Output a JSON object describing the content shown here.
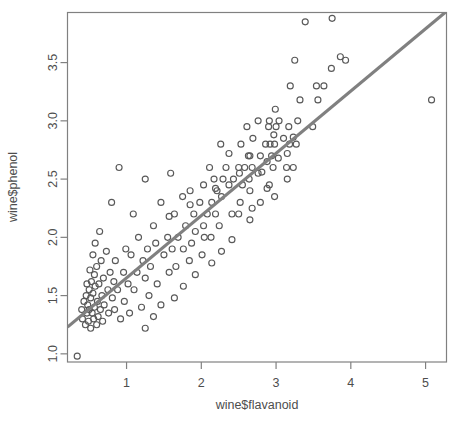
{
  "chart_data": {
    "type": "scatter",
    "title": "",
    "subtitle": "",
    "xlabel": "wine$flavanoid",
    "ylabel": "wine$phenol",
    "xlim": [
      0.21,
      5.28
    ],
    "ylim": [
      0.93,
      3.93
    ],
    "xticks": [
      1,
      2,
      3,
      4,
      5
    ],
    "yticks": [
      1.0,
      1.5,
      2.0,
      2.5,
      3.0,
      3.5
    ],
    "xtick_labels": [
      "1",
      "2",
      "3",
      "4",
      "5"
    ],
    "ytick_labels": [
      "1.0",
      "1.5",
      "2.0",
      "2.5",
      "3.0",
      "3.5"
    ],
    "grid": false,
    "legend": null,
    "point_style": {
      "marker": "open-circle",
      "radius": 3.0,
      "color": "#595959"
    },
    "annotations": [],
    "series": [
      {
        "name": "wine samples",
        "type": "scatter",
        "x": [
          5.08,
          3.75,
          3.64,
          3.49,
          3.39,
          3.32,
          3.29,
          3.27,
          3.25,
          3.23,
          3.19,
          3.18,
          3.17,
          3.15,
          3.14,
          3.1,
          3.04,
          3.03,
          3.0,
          2.98,
          2.97,
          2.96,
          2.94,
          2.92,
          2.91,
          2.9,
          2.88,
          2.86,
          2.81,
          2.79,
          2.76,
          2.76,
          2.69,
          2.68,
          2.65,
          2.65,
          2.64,
          2.63,
          2.61,
          2.58,
          2.55,
          2.53,
          2.52,
          2.51,
          2.5,
          2.5,
          2.43,
          2.41,
          2.37,
          2.33,
          2.29,
          2.27,
          2.26,
          2.24,
          2.21,
          2.19,
          2.17,
          2.14,
          2.13,
          2.11,
          2.08,
          2.04,
          2.03,
          2.01,
          1.98,
          1.92,
          1.9,
          1.87,
          1.85,
          1.84,
          1.79,
          1.76,
          1.75,
          1.69,
          1.66,
          1.64,
          1.61,
          1.59,
          1.57,
          1.55,
          1.5,
          1.46,
          1.41,
          1.39,
          1.36,
          1.32,
          1.3,
          1.28,
          1.25,
          1.25,
          1.22,
          1.2,
          1.16,
          1.14,
          1.1,
          1.09,
          1.06,
          1.04,
          1.02,
          0.99,
          0.97,
          0.96,
          0.92,
          0.9,
          0.88,
          0.85,
          0.84,
          0.83,
          0.81,
          0.8,
          0.78,
          0.76,
          0.75,
          0.73,
          0.7,
          0.69,
          0.68,
          0.67,
          0.66,
          0.65,
          0.64,
          0.63,
          0.62,
          0.61,
          0.6,
          0.6,
          0.58,
          0.58,
          0.57,
          0.57,
          0.56,
          0.55,
          0.55,
          0.54,
          0.53,
          0.52,
          0.52,
          0.51,
          0.5,
          0.5,
          0.49,
          0.48,
          0.47,
          0.47,
          0.46,
          0.45,
          0.43,
          0.41,
          0.4,
          0.34,
          3.93,
          3.86,
          3.74,
          3.56,
          3.54,
          3.23,
          3.15,
          2.99,
          2.98,
          2.91,
          2.88,
          2.79,
          2.68,
          2.65,
          2.41,
          2.37,
          2.27,
          2.19,
          2.14,
          2.03,
          1.92,
          1.85,
          1.76,
          1.64,
          1.57,
          1.46,
          1.36,
          1.25
        ],
        "y": [
          3.18,
          3.88,
          3.3,
          2.95,
          3.85,
          3.18,
          3.0,
          2.8,
          3.52,
          2.86,
          3.3,
          2.8,
          2.95,
          2.72,
          2.6,
          2.85,
          3.0,
          2.68,
          2.95,
          2.8,
          2.88,
          2.6,
          2.7,
          2.8,
          2.45,
          2.95,
          2.65,
          2.8,
          2.56,
          2.7,
          2.55,
          3.0,
          2.85,
          2.6,
          2.4,
          2.7,
          2.5,
          2.7,
          2.95,
          2.6,
          2.45,
          2.8,
          2.3,
          2.55,
          2.2,
          2.6,
          2.5,
          2.2,
          2.45,
          2.6,
          2.5,
          2.35,
          2.8,
          2.1,
          2.4,
          2.2,
          2.5,
          2.3,
          2.0,
          2.6,
          2.2,
          2.0,
          2.45,
          1.85,
          2.3,
          2.05,
          2.2,
          1.95,
          2.4,
          1.8,
          2.1,
          1.9,
          2.35,
          2.0,
          1.75,
          2.2,
          1.9,
          2.55,
          1.7,
          2.0,
          1.85,
          2.3,
          1.6,
          1.95,
          2.1,
          1.75,
          1.5,
          1.9,
          2.5,
          1.65,
          1.8,
          1.4,
          2.0,
          1.7,
          1.55,
          2.2,
          1.85,
          1.35,
          1.6,
          1.9,
          1.45,
          1.7,
          1.3,
          2.6,
          1.55,
          1.8,
          1.38,
          1.62,
          1.48,
          2.3,
          1.7,
          1.35,
          1.55,
          1.88,
          1.42,
          1.65,
          1.28,
          1.5,
          1.8,
          1.38,
          2.05,
          1.6,
          1.32,
          1.45,
          1.75,
          1.25,
          1.58,
          1.95,
          1.4,
          1.68,
          1.3,
          1.52,
          1.85,
          1.35,
          1.62,
          1.22,
          1.48,
          1.72,
          1.38,
          1.55,
          1.28,
          1.42,
          1.6,
          1.35,
          1.5,
          1.25,
          1.45,
          1.3,
          1.38,
          0.98,
          3.52,
          3.55,
          3.45,
          3.18,
          3.3,
          2.6,
          2.5,
          3.1,
          2.35,
          3.0,
          2.42,
          2.3,
          2.25,
          2.15,
          1.98,
          2.72,
          1.88,
          2.42,
          1.78,
          2.1,
          1.68,
          2.28,
          1.58,
          1.48,
          2.18,
          1.42,
          1.32,
          1.22
        ]
      }
    ],
    "fit_line": {
      "name": "linear regression",
      "type": "line",
      "color": "#808080",
      "width": 3,
      "x_start": 0.21,
      "y_start": 1.23,
      "x_end": 5.28,
      "y_end": 3.94
    }
  }
}
